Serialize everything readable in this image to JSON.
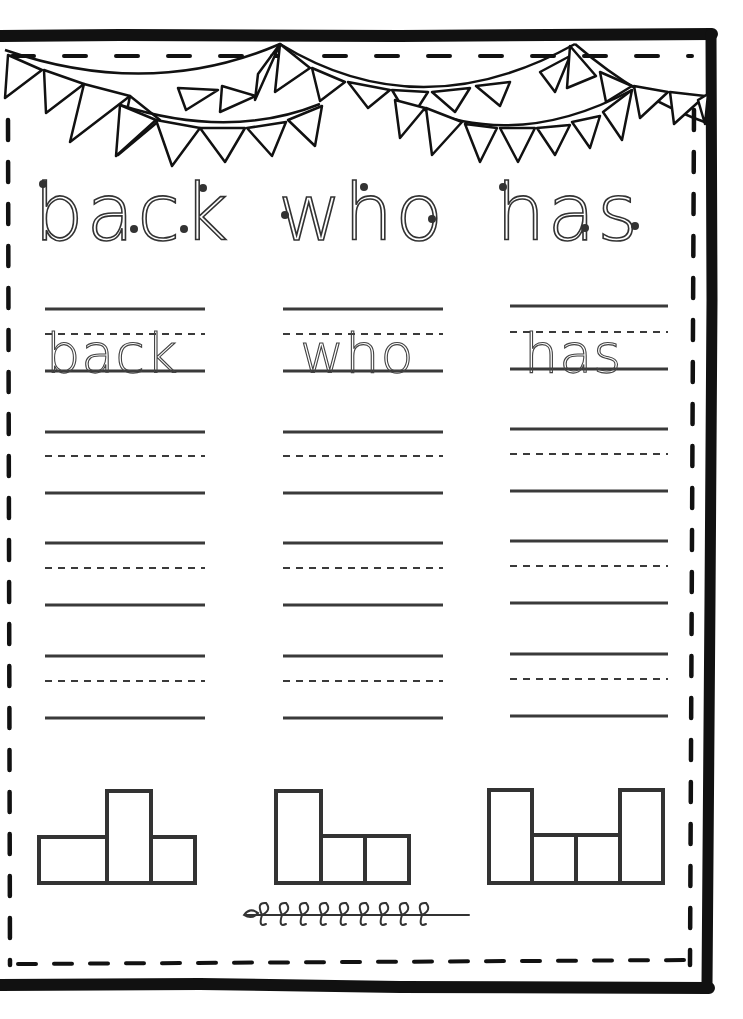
{
  "worksheet": {
    "title_words": [
      "back",
      "who",
      "has"
    ],
    "trace_words": [
      "back",
      "who",
      "has"
    ],
    "practice_rows_per_word": 3,
    "word_shapes": [
      {
        "word": "back",
        "boxes": [
          "short",
          "tall",
          "short-narrow"
        ]
      },
      {
        "word": "who",
        "boxes": [
          "tall",
          "short",
          "short"
        ]
      },
      {
        "word": "has",
        "boxes": [
          "tall",
          "short",
          "short",
          "tall"
        ]
      }
    ],
    "decorations": {
      "banner": "bunting-flags",
      "footer_ornament": "leaf-vine"
    }
  },
  "colors": {
    "border": "#111111",
    "line": "#3a3a3a",
    "trace": "#444444",
    "start_dot": "#333333",
    "background": "#ffffff"
  }
}
